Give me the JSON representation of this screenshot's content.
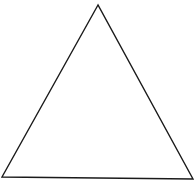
{
  "diagram": {
    "shape": "triangle",
    "background": "#ffffff",
    "stroke_color": "#1a1a1a",
    "stroke_width": 1.4,
    "fill": "none",
    "vertices": [
      {
        "name": "apex",
        "x": 98,
        "y": 5
      },
      {
        "name": "bottom-left",
        "x": 2,
        "y": 177
      },
      {
        "name": "bottom-right",
        "x": 193,
        "y": 179
      }
    ]
  }
}
